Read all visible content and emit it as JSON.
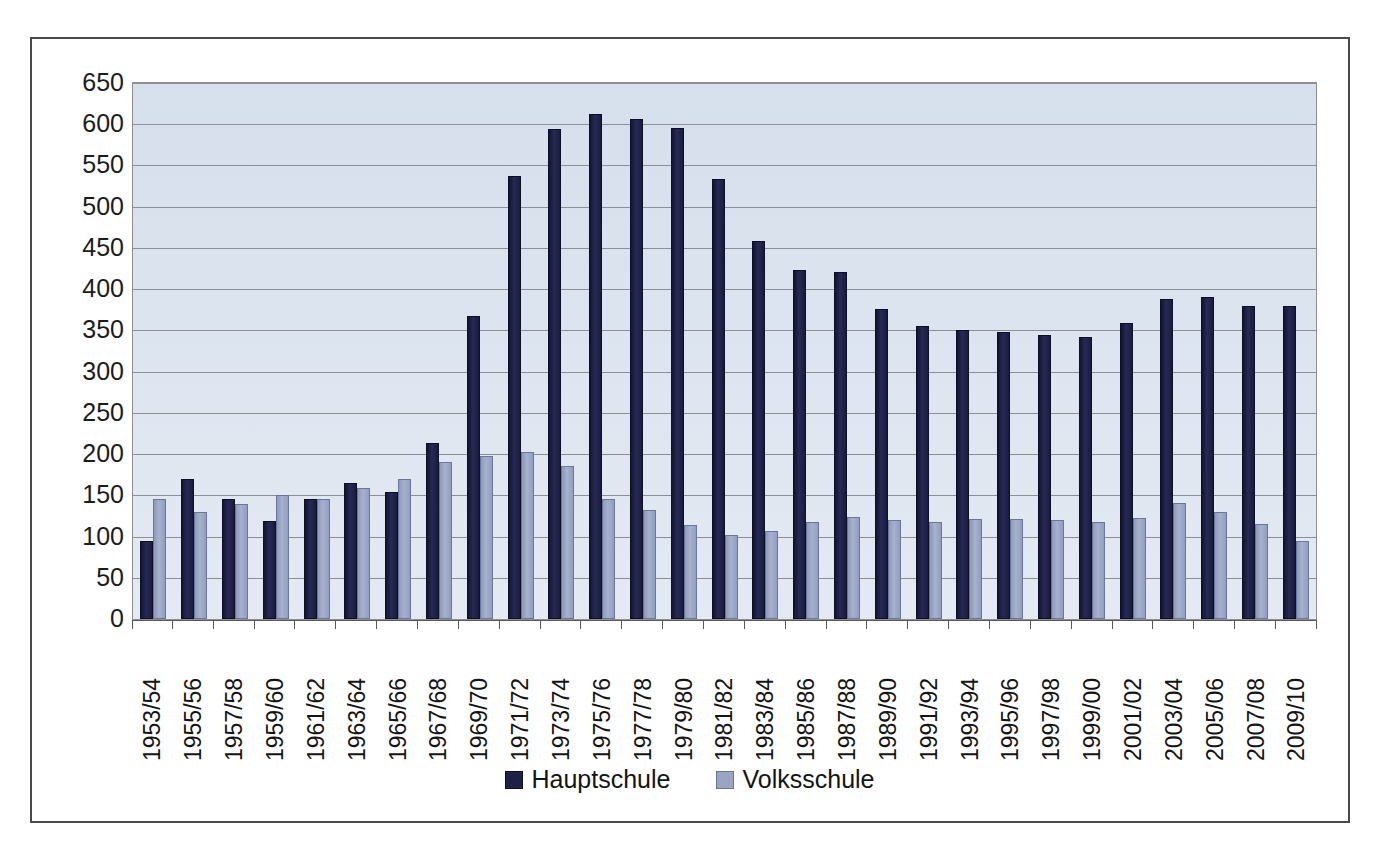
{
  "chart_data": {
    "type": "bar",
    "title": "",
    "subtitle": "",
    "xlabel": "",
    "ylabel": "",
    "ylim": [
      0,
      650
    ],
    "ytick_step": 50,
    "yticks": [
      650,
      600,
      550,
      500,
      450,
      400,
      350,
      300,
      250,
      200,
      150,
      100,
      50,
      0
    ],
    "grid": true,
    "legend_position": "bottom-center",
    "categories": [
      "1953/54",
      "1955/56",
      "1957/58",
      "1959/60",
      "1961/62",
      "1963/64",
      "1965/66",
      "1967/68",
      "1969/70",
      "1971/72",
      "1973/74",
      "1975/76",
      "1977/78",
      "1979/80",
      "1981/82",
      "1983/84",
      "1985/86",
      "1987/88",
      "1989/90",
      "1991/92",
      "1993/94",
      "1995/96",
      "1997/98",
      "1999/00",
      "2001/02",
      "2003/04",
      "2005/06",
      "2007/08",
      "2009/10"
    ],
    "series": [
      {
        "name": "Hauptschule",
        "color": "#1e2045",
        "values": [
          95,
          170,
          146,
          119,
          145,
          165,
          154,
          214,
          368,
          537,
          594,
          613,
          606,
          595,
          534,
          459,
          423,
          421,
          376,
          355,
          350,
          348,
          345,
          342,
          359,
          388,
          391,
          380,
          379
        ]
      },
      {
        "name": "Volksschule",
        "color": "#9aa5c4",
        "values": [
          145,
          130,
          139,
          150,
          145,
          159,
          170,
          191,
          198,
          202,
          185,
          145,
          132,
          114,
          102,
          107,
          118,
          124,
          120,
          118,
          121,
          121,
          120,
          118,
          123,
          141,
          130,
          115,
          95
        ]
      }
    ]
  },
  "legend": {
    "items": [
      {
        "label": "Hauptschule",
        "color": "#1e2045"
      },
      {
        "label": "Volksschule",
        "color": "#9aa5c4"
      }
    ]
  },
  "style": {
    "plot_background": "#dde4ee",
    "gridline_color": "#8b8f96",
    "frame_color": "#4a4a4a",
    "axis_color": "#5a5a5a",
    "text_color": "#141414"
  }
}
